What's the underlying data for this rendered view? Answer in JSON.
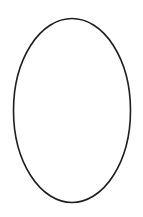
{
  "canvas": {
    "width": 143,
    "height": 217,
    "background": "#ffffff"
  },
  "shapes": [
    {
      "type": "ellipse",
      "cx": 72,
      "cy": 110.5,
      "rx": 58.5,
      "ry": 92,
      "stroke": "#1e1e1e",
      "stroke_width": 1.6,
      "fill": "none"
    }
  ]
}
